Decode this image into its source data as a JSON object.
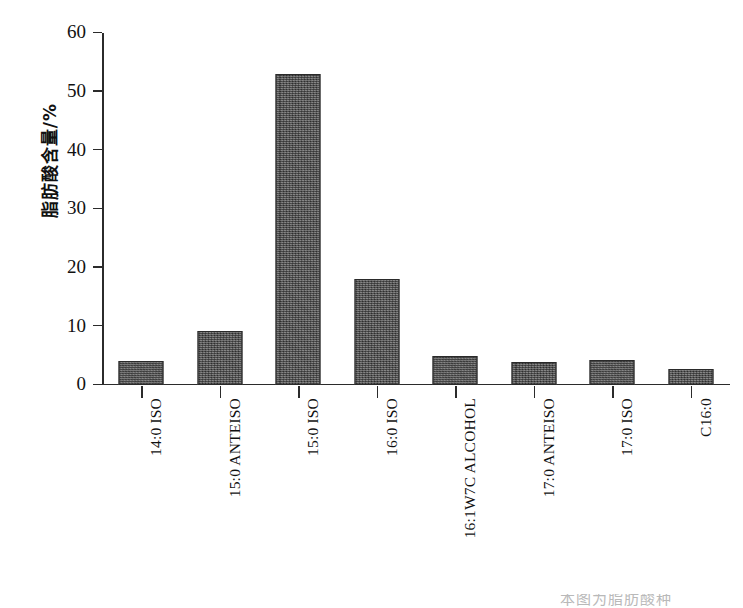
{
  "chart_data": {
    "type": "bar",
    "title": "",
    "subtitle": "",
    "xlabel": "",
    "ylabel": "脂肪酸含量/%",
    "ylim": [
      0,
      60
    ],
    "yticks": [
      0,
      10,
      20,
      30,
      40,
      50,
      60
    ],
    "grid": false,
    "legend": null,
    "bar_color": "#5b5b5b",
    "bar_edge_color": "#2a2a2a",
    "axis_color": "#2b2b2b",
    "categories": [
      "14:0 ISO",
      "15:0 ANTEISO",
      "15:0 ISO",
      "16:0 ISO",
      "16:1W7C ALCOHOL",
      "17:0 ANTEISO",
      "17:0 ISO",
      "C16:0"
    ],
    "values": [
      4.1,
      9.2,
      53.0,
      18.0,
      5.0,
      3.9,
      4.3,
      2.7
    ],
    "series": [
      {
        "name": "脂肪酸含量",
        "values": [
          4.1,
          9.2,
          53.0,
          18.0,
          5.0,
          3.9,
          4.3,
          2.7
        ]
      }
    ],
    "annotations": []
  },
  "caption_partial": "本图为脂肪酸种"
}
